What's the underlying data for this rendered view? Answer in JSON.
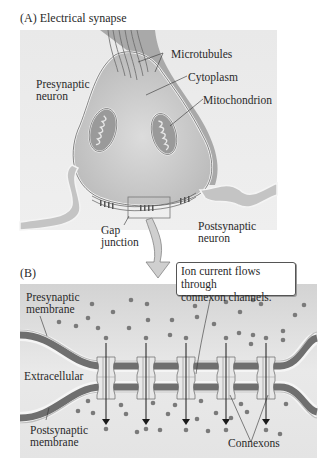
{
  "panel_a": {
    "title": "(A)  Electrical synapse",
    "labels": {
      "microtubules": "Microtubules",
      "cytoplasm": "Cytoplasm",
      "presynaptic_neuron_1": "Presynaptic",
      "presynaptic_neuron_2": "neuron",
      "mitochondrion": "Mitochondrion",
      "gap_junction_1": "Gap",
      "gap_junction_2": "junction",
      "postsynaptic_neuron_1": "Postsynaptic",
      "postsynaptic_neuron_2": "neuron"
    }
  },
  "panel_b": {
    "title": "(B)",
    "callout_1": "Ion current flows through",
    "callout_2": "connexon channels.",
    "labels": {
      "presynaptic_membrane_1": "Presynaptic",
      "presynaptic_membrane_2": "membrane",
      "extracellular": "Extracellular",
      "postsynaptic_membrane_1": "Postsynaptic",
      "postsynaptic_membrane_2": "membrane",
      "connexons": "Connexons"
    },
    "connexon_count": 5
  },
  "colors": {
    "background_panel": "#e6e6e6",
    "neuron_fill": "#c8c8c8",
    "membrane_dark": "#6f6f6f",
    "membrane_light": "#f2f2f2",
    "ion_dot": "#7a7a7a",
    "arrow": "#1a1a1a"
  }
}
